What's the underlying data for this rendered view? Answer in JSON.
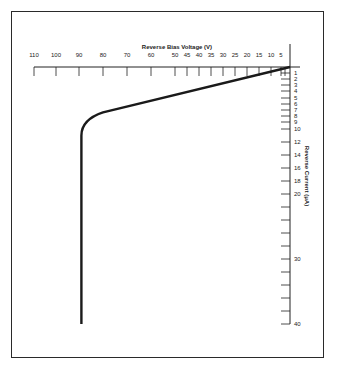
{
  "chart_data": {
    "type": "line",
    "title": "",
    "xlabel": "Reverse Bias Voltage (V)",
    "ylabel": "Reverse Current (μA)",
    "x_axis_position": "top",
    "y_axis_position": "right",
    "x_direction": "reversed (increasing to the left)",
    "y_direction": "reversed (increasing downward)",
    "x_ticks": [
      110,
      100,
      90,
      80,
      70,
      60,
      50,
      45,
      40,
      35,
      30,
      25,
      20,
      15,
      10,
      5
    ],
    "y_tick_labels": [
      1,
      2,
      3,
      4,
      5,
      6,
      7,
      8,
      9,
      10,
      12,
      14,
      16,
      18,
      20,
      30,
      40
    ],
    "xlim": [
      0,
      110
    ],
    "ylim": [
      0,
      40
    ],
    "grid": false,
    "legend": null,
    "series": [
      {
        "name": "Reverse characteristic",
        "x": [
          0,
          10,
          20,
          30,
          40,
          50,
          60,
          70,
          80,
          85,
          88,
          89,
          89,
          89
        ],
        "y": [
          0,
          1.0,
          2.0,
          3.0,
          4.0,
          5.0,
          5.8,
          6.6,
          7.4,
          8.0,
          9.0,
          11,
          20,
          40
        ]
      }
    ]
  }
}
